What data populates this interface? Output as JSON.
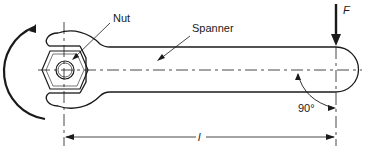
{
  "figure": {
    "type": "diagram",
    "labels": {
      "nut": "Nut",
      "spanner": "Spanner",
      "force": "F",
      "length": "l",
      "angle": "90°"
    },
    "colors": {
      "line": "#1a1a1a",
      "background": "#ffffff"
    }
  }
}
